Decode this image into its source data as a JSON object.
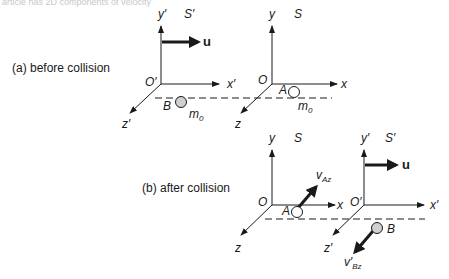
{
  "header_fragment": "article has 2D components of velocity",
  "panel_a": {
    "caption": "(a) before collision",
    "frame_primed": {
      "name": "S′",
      "x": "x′",
      "y": "y′",
      "z": "z′",
      "origin": "O′"
    },
    "frame": {
      "name": "S",
      "x": "x",
      "y": "y",
      "z": "z",
      "origin": "O"
    },
    "velocity_label": "u",
    "particle_B": {
      "label": "B",
      "mass": "m",
      "mass_sub": "0"
    },
    "particle_A": {
      "label": "A",
      "mass": "m",
      "mass_sub": "0"
    }
  },
  "panel_b": {
    "caption": "(b) after collision",
    "frame": {
      "name": "S",
      "x": "x",
      "y": "y",
      "z": "z",
      "origin": "O"
    },
    "frame_primed": {
      "name": "S′",
      "x": "x′",
      "y": "y′",
      "z": "z′",
      "origin": "O′"
    },
    "velocity_label": "u",
    "particle_A": {
      "label": "A",
      "v": "v",
      "v_sub": "Az"
    },
    "particle_B": {
      "label": "B",
      "v": "v′",
      "v_sub": "Bz"
    }
  },
  "colors": {
    "ink": "#1a1a1a",
    "ball_fill_B": "#d0d0d0",
    "ball_fill_A": "#ffffff"
  }
}
